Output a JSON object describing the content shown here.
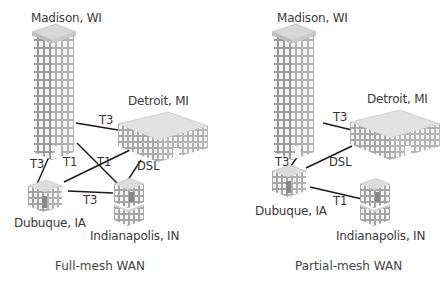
{
  "diagrams": [
    {
      "caption": "Full-mesh WAN",
      "sites": {
        "madison": "Madison, WI",
        "detroit": "Detroit, MI",
        "dubuque": "Dubuque, IA",
        "indianapolis": "Indianapolis, IN"
      },
      "links": [
        {
          "from": "madison",
          "to": "detroit",
          "type": "T3"
        },
        {
          "from": "madison",
          "to": "dubuque",
          "type": "T3"
        },
        {
          "from": "madison",
          "to": "indianapolis",
          "type": "T1"
        },
        {
          "from": "detroit",
          "to": "dubuque",
          "type": "T1"
        },
        {
          "from": "detroit",
          "to": "indianapolis",
          "type": "DSL"
        },
        {
          "from": "dubuque",
          "to": "indianapolis",
          "type": "T3"
        }
      ]
    },
    {
      "caption": "Partial-mesh WAN",
      "sites": {
        "madison": "Madison, WI",
        "detroit": "Detroit, MI",
        "dubuque": "Dubuque, IA",
        "indianapolis": "Indianapolis, IN"
      },
      "links": [
        {
          "from": "madison",
          "to": "detroit",
          "type": "T3"
        },
        {
          "from": "madison",
          "to": "dubuque",
          "type": "T3"
        },
        {
          "from": "dubuque",
          "to": "detroit",
          "type": "DSL"
        },
        {
          "from": "dubuque",
          "to": "indianapolis",
          "type": "T1"
        }
      ]
    }
  ],
  "icons": {
    "madison": "skyscraper-icon",
    "detroit": "office-building-icon",
    "dubuque": "small-building-icon",
    "indianapolis": "small-building-icon"
  }
}
